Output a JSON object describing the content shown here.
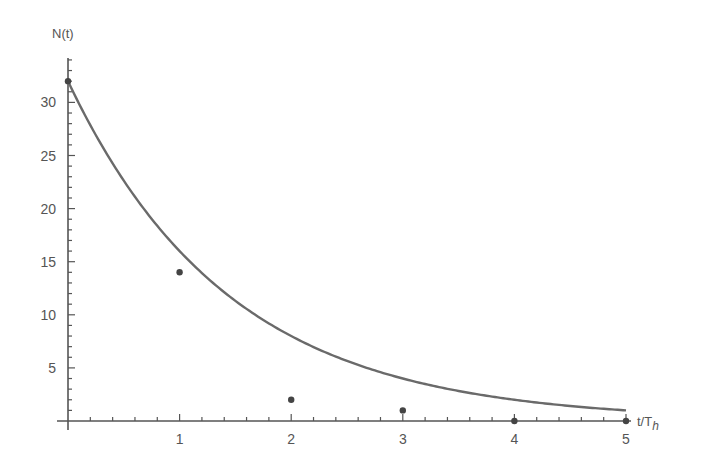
{
  "chart_data": {
    "type": "scatter",
    "title": "",
    "xlabel": "t/T_h",
    "xlabel_main": "t/T",
    "xlabel_sub": "h",
    "ylabel": "N(t)",
    "xlim": [
      0,
      5
    ],
    "ylim": [
      0,
      33
    ],
    "x_ticks": [
      1,
      2,
      3,
      4,
      5
    ],
    "y_ticks": [
      5,
      10,
      15,
      20,
      25,
      30
    ],
    "grid": false,
    "series": [
      {
        "name": "measured",
        "type": "scatter",
        "x": [
          0,
          1,
          2,
          3,
          4,
          5
        ],
        "y": [
          32,
          14,
          2,
          1,
          0,
          0
        ]
      },
      {
        "name": "N(t) = 32 * 2^(-t)",
        "type": "line",
        "formula": "32*2^(-t)",
        "x": [
          0,
          1,
          2,
          3,
          4,
          5
        ],
        "y": [
          32,
          16,
          8,
          4,
          2,
          1
        ]
      }
    ],
    "colors": {
      "axis": "#555555",
      "curve": "#6a6a6a",
      "points": "#444444"
    }
  }
}
